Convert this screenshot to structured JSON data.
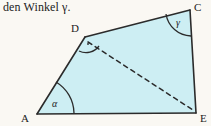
{
  "caption": {
    "text": "den Winkel γ."
  },
  "figure": {
    "name": "quadrilateral-ACEA-with-diagonal",
    "fill_color": "#cdeef3",
    "stroke_color": "#2b2b2b",
    "background_color": "#faf8f3",
    "vertices": [
      {
        "id": "A",
        "label": "A",
        "x": 37,
        "y": 114
      },
      {
        "id": "D",
        "label": "D",
        "x": 85,
        "y": 37
      },
      {
        "id": "C",
        "label": "C",
        "x": 190,
        "y": 10
      },
      {
        "id": "E",
        "label": "E",
        "x": 196,
        "y": 113
      }
    ],
    "vertex_labels": [
      {
        "id": "A",
        "text": "A",
        "x": 23,
        "y": 120
      },
      {
        "id": "D",
        "text": "D",
        "x": 73,
        "y": 31
      },
      {
        "id": "C",
        "text": "C",
        "x": 195,
        "y": 10
      },
      {
        "id": "E",
        "text": "E",
        "x": 200,
        "y": 122
      }
    ],
    "edges": [
      {
        "name": "edge-A-D",
        "from": "A",
        "to": "D",
        "style": "solid"
      },
      {
        "name": "edge-D-C",
        "from": "D",
        "to": "C",
        "style": "solid"
      },
      {
        "name": "edge-C-E",
        "from": "C",
        "to": "E",
        "style": "solid"
      },
      {
        "name": "edge-E-A",
        "from": "E",
        "to": "A",
        "style": "solid"
      }
    ],
    "diagonal": {
      "name": "diagonal-D-E",
      "from": "D",
      "to": "E",
      "style": "dashed"
    },
    "angles": [
      {
        "id": "alpha",
        "label": "α",
        "vertex": "A",
        "label_x": 52,
        "label_y": 107
      },
      {
        "id": "gamma",
        "label": "γ",
        "vertex": "C",
        "label_x": 178,
        "label_y": 25
      },
      {
        "id": "delta",
        "label": "",
        "vertex": "D",
        "marker": "dot"
      }
    ]
  }
}
